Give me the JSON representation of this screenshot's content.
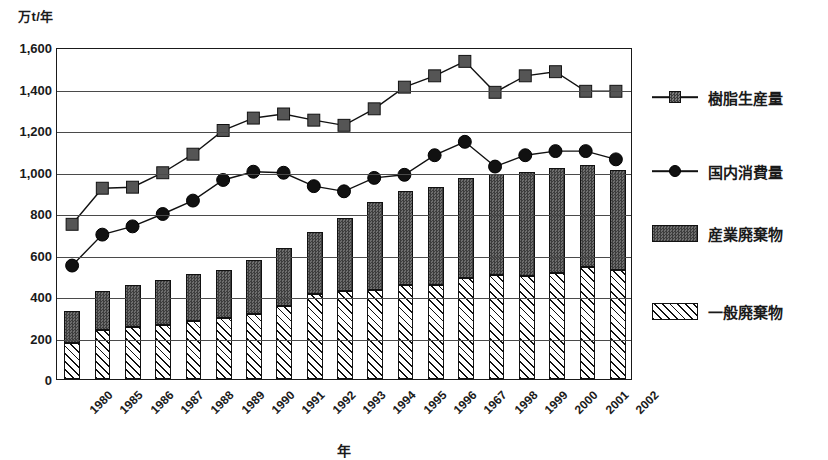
{
  "chart_data": {
    "type": "bar",
    "title": "",
    "subtitle": "",
    "xlabel": "年",
    "ylabel": "万t/年",
    "ylim": [
      0,
      1600
    ],
    "ytick_step": 200,
    "yticks": [
      "1,600",
      "1,400",
      "1,200",
      "1,000",
      "800",
      "600",
      "400",
      "200",
      "0"
    ],
    "ytick_values": [
      1600,
      1400,
      1200,
      1000,
      800,
      600,
      400,
      200,
      0
    ],
    "grid": true,
    "legend_position": "right",
    "stacked": true,
    "categories": [
      "1980",
      "1985",
      "1986",
      "1987",
      "1988",
      "1989",
      "1990",
      "1991",
      "1992",
      "1993",
      "1994",
      "1995",
      "1996",
      "1967",
      "1998",
      "1999",
      "2000",
      "2001",
      "2002"
    ],
    "series": [
      {
        "name": "樹脂生産量",
        "type": "line",
        "marker": "square",
        "color": "#4a4a4a",
        "values": [
          750,
          925,
          930,
          1000,
          1090,
          1205,
          1265,
          1285,
          1255,
          1230,
          1310,
          1415,
          1470,
          1540,
          1390,
          1470,
          1490,
          1395,
          1395
        ]
      },
      {
        "name": "国内消費量",
        "type": "line",
        "marker": "circle",
        "color": "#111111",
        "values": [
          550,
          700,
          740,
          800,
          865,
          965,
          1005,
          1000,
          935,
          910,
          975,
          990,
          1085,
          1150,
          1030,
          1085,
          1105,
          1105,
          1065
        ]
      },
      {
        "name": "産業廃棄物",
        "type": "bar",
        "fill": "dark",
        "color": "#4a4a4a",
        "values": [
          155,
          190,
          205,
          215,
          225,
          230,
          260,
          280,
          300,
          350,
          425,
          450,
          470,
          485,
          490,
          505,
          505,
          490,
          480
        ]
      },
      {
        "name": "一般廃棄物",
        "type": "bar",
        "fill": "hatched",
        "color": "#ffffff",
        "values": [
          175,
          235,
          250,
          260,
          280,
          295,
          315,
          350,
          410,
          425,
          430,
          455,
          455,
          485,
          500,
          495,
          510,
          540,
          525
        ]
      }
    ],
    "totals": [
      330,
      425,
      455,
      475,
      505,
      525,
      575,
      630,
      710,
      775,
      855,
      905,
      925,
      970,
      990,
      1000,
      1015,
      1030,
      1005
    ]
  },
  "legend": {
    "items": [
      {
        "label": "樹脂生産量",
        "kind": "line-square"
      },
      {
        "label": "国内消費量",
        "kind": "line-circle"
      },
      {
        "label": "産業廃棄物",
        "kind": "box-dark"
      },
      {
        "label": "一般廃棄物",
        "kind": "box-hatch"
      }
    ]
  }
}
